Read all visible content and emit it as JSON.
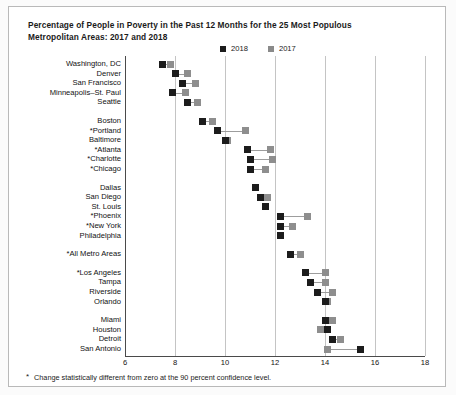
{
  "chart_data": {
    "type": "scatter",
    "title": "Percentage of People in Poverty in the Past 12 Months for the 25 Most Populous Metropolitan Areas: 2017 and 2018",
    "title_line1": "Percentage of People in Poverty in the Past 12 Months for the 25 Most Populous",
    "title_line2": "Metropolitan Areas: 2017 and 2018",
    "xlabel": "",
    "ylabel": "",
    "xlim": [
      6,
      18
    ],
    "xticks": [
      6,
      8,
      10,
      12,
      14,
      16,
      18
    ],
    "grid": true,
    "legend_position": "top-center",
    "legend": [
      {
        "name": "2018",
        "color": "#1c1c1c"
      },
      {
        "name": "2017",
        "color": "#8e8e8e"
      }
    ],
    "footnote": "Change statistically different from zero at the 90 percent confidence level.",
    "footnote_marker": "*",
    "categories": [
      "Washington, DC",
      "Denver",
      "San Francisco",
      "Minneapolis–St. Paul",
      "Seattle",
      "Boston",
      "*Portland",
      "Baltimore",
      "*Atlanta",
      "*Charlotte",
      "*Chicago",
      "Dallas",
      "San Diego",
      "St. Louis",
      "*Phoenix",
      "*New York",
      "Philadelphia",
      "*All Metro Areas",
      "*Los Angeles",
      "Tampa",
      "Riverside",
      "Orlando",
      "Miami",
      "Houston",
      "Detroit",
      "San Antonio"
    ],
    "series": [
      {
        "name": "2018",
        "values": [
          7.5,
          8.0,
          8.3,
          7.9,
          8.5,
          9.1,
          9.7,
          10.0,
          10.9,
          11.0,
          11.0,
          11.2,
          11.4,
          11.6,
          12.2,
          12.2,
          12.2,
          12.6,
          13.2,
          13.4,
          13.7,
          14.0,
          14.0,
          14.1,
          14.3,
          15.4
        ]
      },
      {
        "name": "2017",
        "values": [
          7.8,
          8.5,
          8.8,
          8.4,
          8.9,
          9.5,
          10.8,
          10.1,
          11.8,
          11.9,
          11.6,
          11.2,
          11.7,
          11.6,
          13.3,
          12.7,
          12.2,
          13.0,
          14.0,
          14.0,
          14.3,
          14.1,
          14.3,
          13.8,
          14.6,
          14.1
        ]
      }
    ],
    "group_breaks": [
      5,
      11,
      17,
      18,
      22
    ]
  }
}
